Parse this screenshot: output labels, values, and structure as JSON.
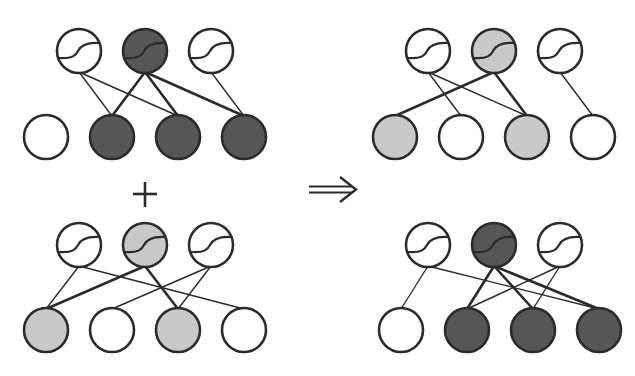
{
  "colors": {
    "background": "#ffffff",
    "stroke": "#2b2b2b",
    "dark_fill": "#565656",
    "light_fill": "#c9c9c9",
    "empty_fill": "#ffffff"
  },
  "node_radius": 22,
  "operators": {
    "plus": "+",
    "implies": "⟹"
  },
  "panels": [
    {
      "id": "top-left",
      "label": "sub-network A (input term)",
      "hidden": [
        {
          "x": 79,
          "y": 51,
          "fill": "empty"
        },
        {
          "x": 145,
          "y": 51,
          "fill": "dark"
        },
        {
          "x": 211,
          "y": 51,
          "fill": "empty"
        }
      ],
      "visible": [
        {
          "x": 46,
          "y": 137,
          "fill": "empty"
        },
        {
          "x": 112,
          "y": 137,
          "fill": "dark"
        },
        {
          "x": 178,
          "y": 137,
          "fill": "dark"
        },
        {
          "x": 244,
          "y": 137,
          "fill": "dark"
        }
      ],
      "edges": [
        {
          "h": 0,
          "v": 1,
          "weight": "thin"
        },
        {
          "h": 0,
          "v": 2,
          "weight": "thin"
        },
        {
          "h": 1,
          "v": 1,
          "weight": "thick"
        },
        {
          "h": 1,
          "v": 2,
          "weight": "thick"
        },
        {
          "h": 1,
          "v": 3,
          "weight": "thick"
        },
        {
          "h": 2,
          "v": 3,
          "weight": "thin"
        }
      ]
    },
    {
      "id": "bottom-left",
      "label": "sub-network B (input term)",
      "hidden": [
        {
          "x": 79,
          "y": 245,
          "fill": "empty"
        },
        {
          "x": 145,
          "y": 245,
          "fill": "light"
        },
        {
          "x": 211,
          "y": 245,
          "fill": "empty"
        }
      ],
      "visible": [
        {
          "x": 46,
          "y": 330,
          "fill": "light"
        },
        {
          "x": 112,
          "y": 330,
          "fill": "empty"
        },
        {
          "x": 178,
          "y": 330,
          "fill": "light"
        },
        {
          "x": 244,
          "y": 330,
          "fill": "empty"
        }
      ],
      "edges": [
        {
          "h": 0,
          "v": 0,
          "weight": "thin"
        },
        {
          "h": 0,
          "v": 3,
          "weight": "thin"
        },
        {
          "h": 1,
          "v": 0,
          "weight": "thick"
        },
        {
          "h": 1,
          "v": 2,
          "weight": "thick"
        },
        {
          "h": 2,
          "v": 1,
          "weight": "thin"
        },
        {
          "h": 2,
          "v": 2,
          "weight": "thin"
        }
      ]
    },
    {
      "id": "top-right",
      "label": "resulting sub-network (light)",
      "hidden": [
        {
          "x": 428,
          "y": 51,
          "fill": "empty"
        },
        {
          "x": 494,
          "y": 51,
          "fill": "light"
        },
        {
          "x": 560,
          "y": 51,
          "fill": "empty"
        }
      ],
      "visible": [
        {
          "x": 395,
          "y": 137,
          "fill": "light"
        },
        {
          "x": 461,
          "y": 137,
          "fill": "empty"
        },
        {
          "x": 527,
          "y": 137,
          "fill": "light"
        },
        {
          "x": 593,
          "y": 137,
          "fill": "empty"
        }
      ],
      "edges": [
        {
          "h": 0,
          "v": 1,
          "weight": "thin"
        },
        {
          "h": 0,
          "v": 2,
          "weight": "thin"
        },
        {
          "h": 1,
          "v": 0,
          "weight": "thick"
        },
        {
          "h": 1,
          "v": 2,
          "weight": "thick"
        },
        {
          "h": 2,
          "v": 3,
          "weight": "thin"
        }
      ]
    },
    {
      "id": "bottom-right",
      "label": "resulting sub-network (dark)",
      "hidden": [
        {
          "x": 428,
          "y": 245,
          "fill": "empty"
        },
        {
          "x": 494,
          "y": 245,
          "fill": "dark"
        },
        {
          "x": 560,
          "y": 245,
          "fill": "empty"
        }
      ],
      "visible": [
        {
          "x": 401,
          "y": 330,
          "fill": "empty"
        },
        {
          "x": 467,
          "y": 330,
          "fill": "dark"
        },
        {
          "x": 533,
          "y": 330,
          "fill": "dark"
        },
        {
          "x": 599,
          "y": 330,
          "fill": "dark"
        }
      ],
      "edges": [
        {
          "h": 0,
          "v": 0,
          "weight": "thin"
        },
        {
          "h": 0,
          "v": 3,
          "weight": "thin"
        },
        {
          "h": 1,
          "v": 1,
          "weight": "thick"
        },
        {
          "h": 1,
          "v": 2,
          "weight": "thick"
        },
        {
          "h": 1,
          "v": 3,
          "weight": "thick"
        },
        {
          "h": 2,
          "v": 1,
          "weight": "thin"
        },
        {
          "h": 2,
          "v": 2,
          "weight": "thin"
        }
      ]
    }
  ]
}
